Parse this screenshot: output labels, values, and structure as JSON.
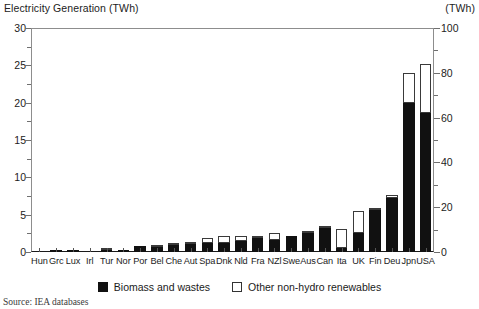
{
  "titles": {
    "left": "Electricity Generation (TWh)",
    "right": "(TWh)"
  },
  "source": "Source: IEA databases",
  "legend": {
    "items": [
      {
        "label": "Biomass and wastes",
        "swatch": "solid",
        "color": "#111111"
      },
      {
        "label": "Other non-hydro renewables",
        "swatch": "open",
        "color": "#ffffff"
      }
    ]
  },
  "axes": {
    "left": {
      "label": "Electricity Generation (TWh)",
      "ticks": [
        "30",
        "25",
        "20",
        "15",
        "10",
        "5",
        "0"
      ],
      "min": 0,
      "max": 30,
      "minor_step": 2.5
    },
    "right": {
      "label": "(TWh)",
      "ticks": [
        "100",
        "80",
        "60",
        "40",
        "20",
        "0"
      ],
      "min": 0,
      "max": 100,
      "minor_step": 10,
      "applies_to": "USA"
    }
  },
  "chart_data": {
    "type": "bar",
    "title": "Electricity Generation (TWh)",
    "xlabel": "",
    "ylabel": "Electricity Generation (TWh)",
    "ylim": [
      0,
      30
    ],
    "ylim_secondary": [
      0,
      100
    ],
    "grid": false,
    "legend_position": "bottom-center",
    "stacked": true,
    "note": "USA bar is plotted against the secondary (right) axis in TWh.",
    "categories": [
      "Hun",
      "Grc",
      "Lux",
      "Irl",
      "Tur",
      "Nor",
      "Por",
      "Bel",
      "Che",
      "Aut",
      "Spa",
      "Dnk",
      "Nld",
      "Fra",
      "NZl",
      "Swe",
      "Aus",
      "Can",
      "Ita",
      "UK",
      "Fin",
      "Deu",
      "Jpn",
      "USA"
    ],
    "series": [
      {
        "name": "Biomass and wastes",
        "color": "#111111",
        "values": [
          0.05,
          0.08,
          0.08,
          0.05,
          0.1,
          0.15,
          0.75,
          0.9,
          1.05,
          1.2,
          1.25,
          1.25,
          1.5,
          1.9,
          1.55,
          2.15,
          2.6,
          3.4,
          0.55,
          2.5,
          5.8,
          7.2,
          20.0,
          62.0
        ]
      },
      {
        "name": "Other non-hydro renewables",
        "color": "#ffffff",
        "values": [
          0.0,
          0.0,
          0.0,
          0.05,
          0.1,
          0.0,
          0.05,
          0.1,
          0.1,
          0.1,
          0.65,
          0.85,
          0.6,
          0.2,
          0.95,
          0.05,
          0.25,
          0.15,
          2.55,
          3.0,
          0.1,
          0.4,
          4.0,
          22.0
        ]
      }
    ],
    "totals": [
      0.05,
      0.08,
      0.08,
      0.1,
      0.2,
      0.15,
      0.8,
      1.0,
      1.15,
      1.3,
      1.9,
      2.1,
      2.1,
      2.1,
      2.5,
      2.2,
      2.85,
      3.55,
      3.1,
      5.5,
      5.9,
      7.6,
      24.0,
      84.0
    ]
  }
}
